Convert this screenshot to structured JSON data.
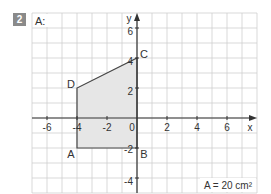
{
  "exercise": {
    "number": "2",
    "part_label": "A:",
    "result": "A = 20 cm²"
  },
  "axes": {
    "x_label": "x",
    "y_label": "y",
    "x_ticks": [
      "-6",
      "-4",
      "-2",
      "0",
      "2",
      "4",
      "6"
    ],
    "y_ticks": [
      "6",
      "4",
      "2",
      "-2",
      "-4"
    ],
    "x_range": [
      -7,
      8
    ],
    "y_range": [
      -5,
      7
    ]
  },
  "polygon": {
    "vertices": [
      {
        "name": "A",
        "x": -4,
        "y": -2
      },
      {
        "name": "B",
        "x": 0,
        "y": -2
      },
      {
        "name": "C",
        "x": 0,
        "y": 4
      },
      {
        "name": "D",
        "x": -4,
        "y": 2
      }
    ],
    "fill": "#e6e6e6",
    "stroke": "#444444"
  },
  "colors": {
    "grid": "#cfcfcf",
    "axis": "#333333",
    "badge": "#8a8a8a"
  }
}
